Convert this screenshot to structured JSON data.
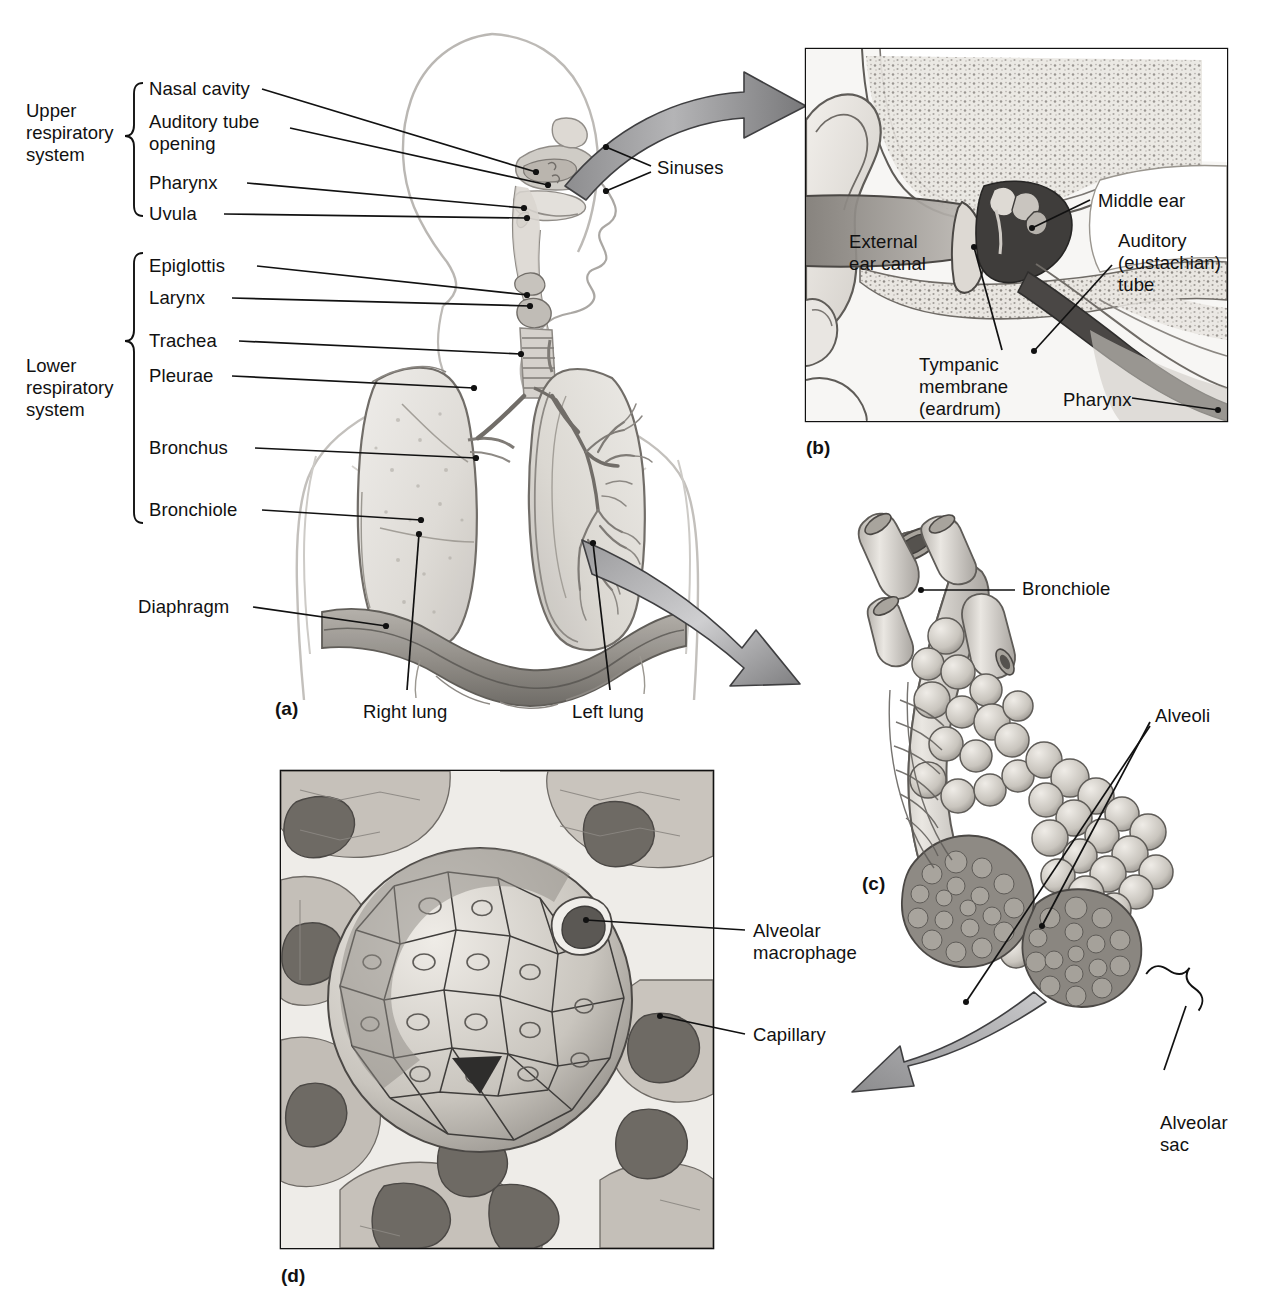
{
  "figure": {
    "domain": "anatomical-illustration",
    "title_visible": false,
    "background": "#ffffff",
    "ink": "#111111",
    "arrow_fill_dark": "#6f6f70",
    "arrow_fill_light": "#d8d8d9",
    "panel_border": "#111111"
  },
  "panels": [
    {
      "id": "a",
      "letter": "(a)",
      "caption_visible": false
    },
    {
      "id": "b",
      "letter": "(b)",
      "caption_visible": false
    },
    {
      "id": "c",
      "letter": "(c)",
      "caption_visible": false
    },
    {
      "id": "d",
      "letter": "(d)",
      "caption_visible": false
    }
  ],
  "panel_a": {
    "group_labels": [
      {
        "id": "upper",
        "lines": [
          "Upper",
          "respiratory",
          "system"
        ]
      },
      {
        "id": "lower",
        "lines": [
          "Lower",
          "respiratory",
          "system"
        ]
      }
    ],
    "upper_items": [
      {
        "id": "nasal-cavity",
        "label": "Nasal cavity"
      },
      {
        "id": "auditory-tube-opening",
        "label": "Auditory tube",
        "label2": "opening"
      },
      {
        "id": "pharynx",
        "label": "Pharynx"
      },
      {
        "id": "uvula",
        "label": "Uvula"
      }
    ],
    "lower_items": [
      {
        "id": "epiglottis",
        "label": "Epiglottis"
      },
      {
        "id": "larynx",
        "label": "Larynx"
      },
      {
        "id": "trachea",
        "label": "Trachea"
      },
      {
        "id": "pleurae",
        "label": "Pleurae"
      },
      {
        "id": "bronchus",
        "label": "Bronchus"
      },
      {
        "id": "bronchiole",
        "label": "Bronchiole"
      }
    ],
    "other_items": [
      {
        "id": "diaphragm",
        "label": "Diaphragm"
      },
      {
        "id": "sinuses",
        "label": "Sinuses"
      },
      {
        "id": "right-lung",
        "label": "Right lung"
      },
      {
        "id": "left-lung",
        "label": "Left lung"
      }
    ]
  },
  "panel_b": {
    "title_visible": false,
    "labels": [
      {
        "id": "external-ear-canal",
        "lines": [
          "External",
          "ear canal"
        ]
      },
      {
        "id": "middle-ear",
        "lines": [
          "Middle ear"
        ]
      },
      {
        "id": "auditory-eustachian-tube",
        "lines": [
          "Auditory",
          "(eustachian)",
          "tube"
        ]
      },
      {
        "id": "tympanic-membrane",
        "lines": [
          "Tympanic",
          "membrane",
          "(eardrum)"
        ]
      },
      {
        "id": "pharynx-b",
        "lines": [
          "Pharynx"
        ]
      }
    ]
  },
  "panel_c": {
    "labels": [
      {
        "id": "bronchiole-c",
        "lines": [
          "Bronchiole"
        ]
      },
      {
        "id": "alveoli",
        "lines": [
          "Alveoli"
        ]
      },
      {
        "id": "alveolar-sac",
        "lines": [
          "Alveolar",
          "sac"
        ]
      }
    ]
  },
  "panel_d": {
    "labels": [
      {
        "id": "alveolar-macrophage",
        "lines": [
          "Alveolar",
          "macrophage"
        ]
      },
      {
        "id": "capillary",
        "lines": [
          "Capillary"
        ]
      }
    ]
  }
}
